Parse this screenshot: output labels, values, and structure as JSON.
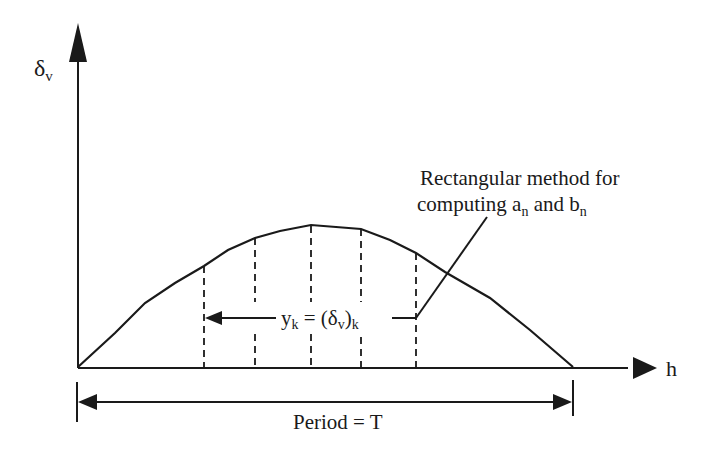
{
  "diagram": {
    "y_axis_label": {
      "main": "δ",
      "sub": "v"
    },
    "x_axis_label": "h",
    "annotation": {
      "line1": "Rectangular method for",
      "line2_prefix": "computing a",
      "line2_sub1": "n",
      "line2_mid": " and b",
      "line2_sub2": "n"
    },
    "ordinate_label": {
      "y": "y",
      "y_sub": "k",
      "eq": " = (δ",
      "d_sub": "v",
      "close": ")",
      "k_sub": "k"
    },
    "period_label": "Period = T",
    "curve": {
      "description": "Half-wave shaped curve starting at origin, rising to a peak near the middle and returning to zero at h = T",
      "ordinates_count": 5
    },
    "colors": {
      "ink": "#1a1a1a",
      "background": "#ffffff"
    }
  }
}
